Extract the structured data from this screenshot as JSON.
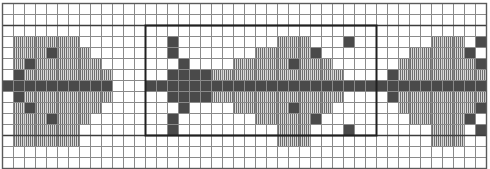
{
  "document": {
    "title": "Pattern Chart",
    "kind": "grid-pattern-chart",
    "description": "Monochrome square-grid charted motif repeating horizontally"
  },
  "colors": {
    "background": "#ffffff",
    "grid_line": "#8a8a8a",
    "grid_line_major": "#3c3c3c",
    "fill_solid": "#4a4a4a",
    "fill_striped_line": "#6e6e6e",
    "fill_striped_bg": "#d8d8d8",
    "repeat_box_outline": "#1f1f1f",
    "border": "#5a5a5a"
  },
  "grid": {
    "columns": 44,
    "rows": 15,
    "cell_width": 11.0,
    "cell_height": 11.0,
    "origin_x": 2,
    "origin_y": 3,
    "show_grid": true,
    "line_width": 1,
    "major_every_columns": 0,
    "major_rows": [
      2,
      12
    ]
  },
  "legend": {
    "symbols": [
      {
        "id": "solid",
        "label": "solid square",
        "fill": "#4a4a4a"
      },
      {
        "id": "striped",
        "label": "vertical stripe square",
        "fill": "#d8d8d8"
      },
      {
        "id": "blank",
        "label": "empty square",
        "fill": "#ffffff"
      }
    ]
  },
  "repeat_box": {
    "enabled": true,
    "col_start": 13,
    "col_end": 34,
    "row_start": 2,
    "row_end": 12,
    "stroke_width": 2
  },
  "chart_data": {
    "type": "heatmap",
    "title": "Pattern Chart",
    "xlabel": "",
    "ylabel": "",
    "grid": true,
    "legend_position": "none",
    "columns": 44,
    "rows": 15,
    "value_map": {
      "0": "blank",
      "1": "striped",
      "2": "solid"
    },
    "categories": [
      "blank",
      "striped",
      "solid"
    ],
    "cells": [
      "00000000000000000000000000000000000000000000",
      "00000000000000000000000000000000000000000000",
      "00000000000000000000000000000000000000000000",
      "01111110000000020000000001110002000000011102",
      "01112111000000020000000111112000000001111120",
      "01211111100000002000011111211100000011111112",
      "02111111110000022221111111111110000211111111",
      "22222222220002222222222222222222222222222222",
      "02111111110000022221111111111110000211111111",
      "01211111100000002000011111211100000011111112",
      "01112111000000020000000111112000000001111120",
      "01111110000000020000000001110002000000011102",
      "01111110000000000000000001110000000000011100",
      "00000000000000000000000000000000000000000000",
      "00000000000000000000000000000000000000000000"
    ]
  }
}
